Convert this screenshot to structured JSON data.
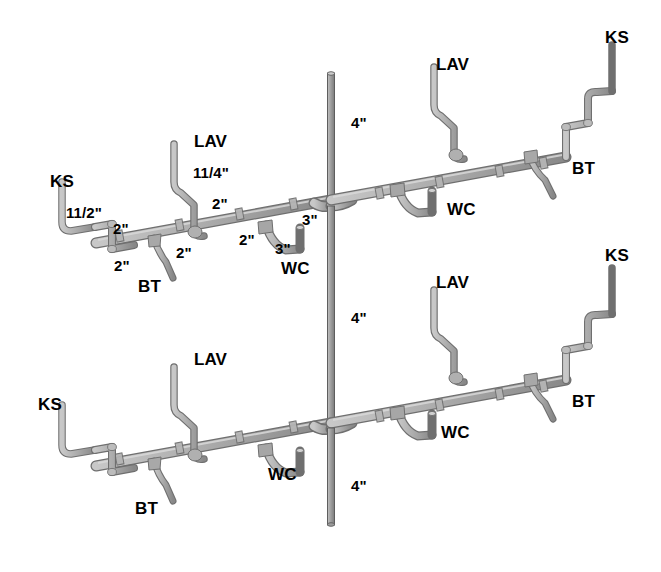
{
  "diagram": {
    "colors": {
      "pipe_fill": "#b3b3b3",
      "pipe_light": "#d2d2d2",
      "pipe_shadow": "#8a8a8a",
      "pipe_edge": "#6f6f6f",
      "stack_fill": "#9a9a9a",
      "text": "#000000",
      "background": "#ffffff"
    },
    "fixture_legend": {
      "KS": "Kitchen Sink",
      "LAV": "Lavatory",
      "BT": "Bathtub",
      "WC": "Water Closet"
    }
  },
  "labels": {
    "upper_floor": [
      {
        "id": "u-ks-left",
        "text": "KS",
        "kind": "fixture",
        "x": 50,
        "y": 173
      },
      {
        "id": "u-dim-112",
        "text": "11/2\"",
        "kind": "dimension",
        "x": 66,
        "y": 205
      },
      {
        "id": "u-dim-2a",
        "text": "2\"",
        "kind": "dimension",
        "x": 113,
        "y": 221
      },
      {
        "id": "u-dim-2b",
        "text": "2\"",
        "kind": "dimension",
        "x": 114,
        "y": 258
      },
      {
        "id": "u-bt-left",
        "text": "BT",
        "kind": "fixture",
        "x": 138,
        "y": 278
      },
      {
        "id": "u-dim-2c",
        "text": "2\"",
        "kind": "dimension",
        "x": 176,
        "y": 245
      },
      {
        "id": "u-lav-left",
        "text": "LAV",
        "kind": "fixture",
        "x": 194,
        "y": 133
      },
      {
        "id": "u-dim-114",
        "text": "11/4\"",
        "kind": "dimension",
        "x": 193,
        "y": 165
      },
      {
        "id": "u-dim-2d",
        "text": "2\"",
        "kind": "dimension",
        "x": 212,
        "y": 196
      },
      {
        "id": "u-dim-2e",
        "text": "2\"",
        "kind": "dimension",
        "x": 239,
        "y": 232
      },
      {
        "id": "u-dim-3a",
        "text": "3\"",
        "kind": "dimension",
        "x": 302,
        "y": 212
      },
      {
        "id": "u-dim-3b",
        "text": "3\"",
        "kind": "dimension",
        "x": 275,
        "y": 241
      },
      {
        "id": "u-wc-left",
        "text": "WC",
        "kind": "fixture",
        "x": 281,
        "y": 260
      },
      {
        "id": "u-dim-4",
        "text": "4\"",
        "kind": "dimension",
        "x": 351,
        "y": 115
      },
      {
        "id": "u-lav-right",
        "text": "LAV",
        "kind": "fixture",
        "x": 436,
        "y": 56
      },
      {
        "id": "u-wc-right",
        "text": "WC",
        "kind": "fixture",
        "x": 447,
        "y": 201
      },
      {
        "id": "u-bt-right",
        "text": "BT",
        "kind": "fixture",
        "x": 572,
        "y": 160
      },
      {
        "id": "u-ks-right",
        "text": "KS",
        "kind": "fixture",
        "x": 605,
        "y": 29
      }
    ],
    "lower_floor": [
      {
        "id": "l-dim-4a",
        "text": "4\"",
        "kind": "dimension",
        "x": 351,
        "y": 310
      },
      {
        "id": "l-lav-right",
        "text": "LAV",
        "kind": "fixture",
        "x": 436,
        "y": 274
      },
      {
        "id": "l-ks-right",
        "text": "KS",
        "kind": "fixture",
        "x": 605,
        "y": 247
      },
      {
        "id": "l-lav-left",
        "text": "LAV",
        "kind": "fixture",
        "x": 194,
        "y": 351
      },
      {
        "id": "l-bt-right",
        "text": "BT",
        "kind": "fixture",
        "x": 572,
        "y": 393
      },
      {
        "id": "l-ks-left",
        "text": "KS",
        "kind": "fixture",
        "x": 38,
        "y": 396
      },
      {
        "id": "l-wc-right",
        "text": "WC",
        "kind": "fixture",
        "x": 441,
        "y": 424
      },
      {
        "id": "l-wc-left",
        "text": "WC",
        "kind": "fixture",
        "x": 268,
        "y": 466
      },
      {
        "id": "l-bt-left",
        "text": "BT",
        "kind": "fixture",
        "x": 135,
        "y": 500
      },
      {
        "id": "l-dim-4b",
        "text": "4\"",
        "kind": "dimension",
        "x": 351,
        "y": 478
      }
    ]
  },
  "pipe_sizes": {
    "stack": "4\"",
    "wc_branch": "3\"",
    "main_branch": "2\"",
    "bt_branch": "2\"",
    "lav_branch": "11/4\"",
    "ks_branch": "11/2\""
  }
}
